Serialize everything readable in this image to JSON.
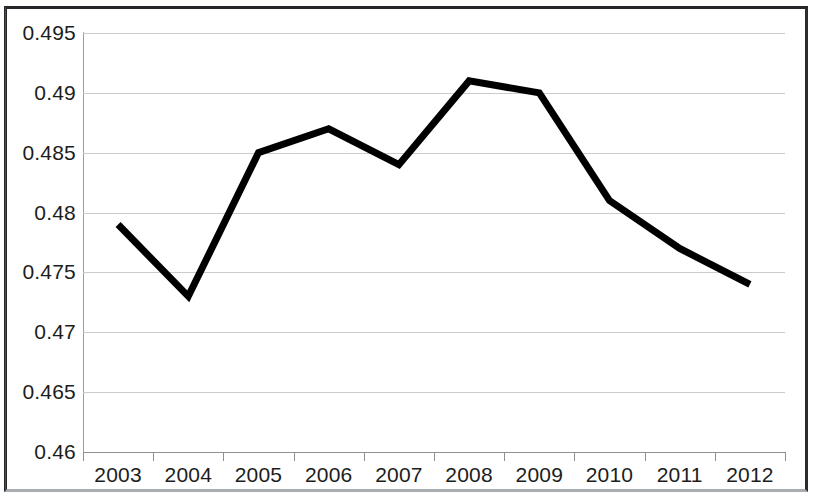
{
  "chart_data": {
    "type": "line",
    "title": "",
    "subtitle": "",
    "xlabel": "",
    "ylabel": "",
    "categories": [
      "2003",
      "2004",
      "2005",
      "2006",
      "2007",
      "2008",
      "2009",
      "2010",
      "2011",
      "2012"
    ],
    "series": [
      {
        "name": "",
        "color": "#000000",
        "values": [
          0.479,
          0.473,
          0.485,
          0.487,
          0.484,
          0.491,
          0.49,
          0.481,
          0.477,
          0.474
        ]
      }
    ],
    "ylim": [
      0.46,
      0.495
    ],
    "ytick_step": 0.005,
    "ytick_labels": [
      "0.495",
      "0.49",
      "0.485",
      "0.48",
      "0.475",
      "0.47",
      "0.465",
      "0.46"
    ],
    "ytick_values": [
      0.495,
      0.49,
      0.485,
      0.48,
      0.475,
      0.47,
      0.465,
      0.46
    ],
    "grid": true,
    "grid_color": "#c9cbcd",
    "legend": false,
    "legend_position": "none",
    "line_width": 7,
    "markers": false,
    "annotations": []
  },
  "figure": {
    "background_color": "#ffffff",
    "border_color": "#24262a",
    "axis_color": "#8d9094",
    "text_color": "#1b1d20"
  }
}
